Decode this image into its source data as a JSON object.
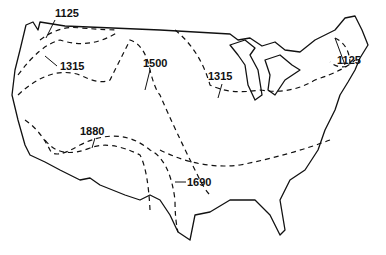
{
  "map": {
    "contour_labels": [
      {
        "id": "nw-1125",
        "text": "1125"
      },
      {
        "id": "nw-1315",
        "text": "1315"
      },
      {
        "id": "central-1500",
        "text": "1500"
      },
      {
        "id": "north-1315",
        "text": "1315"
      },
      {
        "id": "ne-1125",
        "text": "1125"
      },
      {
        "id": "sw-1880",
        "text": "1880"
      },
      {
        "id": "south-1690",
        "text": "1690"
      }
    ]
  }
}
